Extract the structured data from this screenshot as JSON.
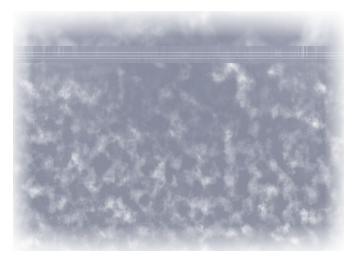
{
  "page": {
    "width": 357,
    "height": 263,
    "background_color": "#ffffff",
    "content_type": "photograph"
  },
  "photo": {
    "subject": "crackle-texture-surface",
    "description": "Macro photograph of a cracked white painted / glazed surface showing a craquelure network",
    "frame": {
      "x": 13,
      "y": 11,
      "width": 331,
      "height": 240
    },
    "base_color": "#fdfdfe",
    "paper_margin_color": "#ffffff",
    "tonal_range": {
      "lightest": "#ffffff",
      "midtone": "#f2f3f6",
      "darkest_crack": "#8a90a0"
    },
    "regions": [
      {
        "name": "upper-band",
        "y_range": [
          0,
          44
        ],
        "description": "Large pale polygonal cells with soft thin cracks",
        "crack_color": "#d6d9e2",
        "cell_scale": "large",
        "density": "low"
      },
      {
        "name": "horizontal-seam",
        "y_range": [
          40,
          49
        ],
        "description": "Subtle horizontal ridge / seam band spanning the full image width",
        "crack_color": "#c8ccd7",
        "cell_scale": "linear",
        "density": "linear"
      },
      {
        "name": "upper-center-dense",
        "y_range": [
          49,
          120
        ],
        "description": "Densest and darkest crack network concentrated in the upper-centre",
        "crack_color": "#9aa0b0",
        "cell_scale": "medium",
        "density": "high"
      },
      {
        "name": "lower-field",
        "y_range": [
          120,
          240
        ],
        "description": "Finer, lighter crackle spread evenly across the lower half",
        "crack_color": "#cbcfd9",
        "cell_scale": "small",
        "density": "medium"
      }
    ],
    "features": [
      {
        "name": "horizontal-seam-line",
        "orientation": "horizontal",
        "y": 45,
        "thickness": 5,
        "color": "#c5c9d5"
      },
      {
        "name": "dark-crack-cluster",
        "cx": 170,
        "cy": 70,
        "radius": 55,
        "color": "#8f95a5"
      },
      {
        "name": "vignette-edge-softening",
        "color": "#ffffff"
      }
    ]
  },
  "accessibility": {
    "alt_text": "Close-up photograph of a white crackled surface with a fine network of hairline cracks and a faint horizontal seam near the top."
  }
}
